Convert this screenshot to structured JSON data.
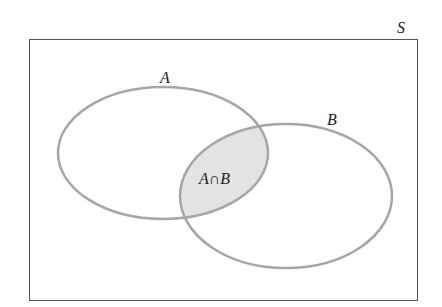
{
  "diagram": {
    "type": "venn",
    "universe_label": "S",
    "sets": [
      {
        "id": "A",
        "label": "A"
      },
      {
        "id": "B",
        "label": "B"
      }
    ],
    "intersection_label": "A∩B",
    "colors": {
      "outline": "#a6a6a6",
      "frame": "#555555",
      "intersection_fill": "#e3e3e3"
    }
  }
}
